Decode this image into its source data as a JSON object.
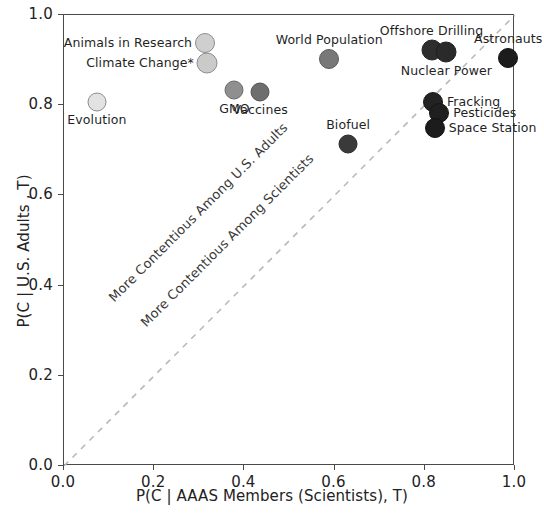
{
  "chart_data": {
    "type": "scatter",
    "title": "",
    "xlabel": "P(C | AAAS Members (Scientists), T)",
    "ylabel": "P(C | U.S. Adults , T)",
    "xlim": [
      0.0,
      1.0
    ],
    "ylim": [
      0.0,
      1.0
    ],
    "xticks": [
      "0.0",
      "0.2",
      "0.4",
      "0.6",
      "0.8",
      "1.0"
    ],
    "yticks": [
      "0.0",
      "0.2",
      "0.4",
      "0.6",
      "0.8",
      "1.0"
    ],
    "xtick_values": [
      0.0,
      0.2,
      0.4,
      0.6,
      0.8,
      1.0
    ],
    "ytick_values": [
      0.0,
      0.2,
      0.4,
      0.6,
      0.8,
      1.0
    ],
    "grid": false,
    "legend": "none",
    "reference_line": {
      "kind": "identity",
      "style": "dashed",
      "color": "#b9b9b9",
      "from": [
        0.0,
        0.0
      ],
      "to": [
        1.0,
        1.0
      ]
    },
    "annotations": [
      {
        "text": "More Contentious Among U.S. Adults",
        "rotation": -45,
        "color": "#3a3a3a"
      },
      {
        "text": "More Contentious Among Scientists",
        "rotation": -45,
        "color": "#3a3a3a"
      }
    ],
    "points": [
      {
        "label": "Evolution",
        "x": 0.073,
        "y": 0.808,
        "color": "#e2e2e2",
        "edge": "#8c8c8c",
        "r": 9.5,
        "label_pos": "below"
      },
      {
        "label": "Animals in Research",
        "x": 0.313,
        "y": 0.938,
        "color": "#cfcfcf",
        "edge": "#8c8c8c",
        "r": 10.0,
        "label_pos": "left"
      },
      {
        "label": "Climate Change*",
        "x": 0.318,
        "y": 0.893,
        "color": "#cacaca",
        "edge": "#8c8c8c",
        "r": 10.5,
        "label_pos": "left"
      },
      {
        "label": "GMO",
        "x": 0.378,
        "y": 0.833,
        "color": "#8f8f8f",
        "edge": "#6a6a6a",
        "r": 9.5,
        "label_pos": "below"
      },
      {
        "label": "Vaccines",
        "x": 0.435,
        "y": 0.83,
        "color": "#6e6e6e",
        "edge": "#565656",
        "r": 9.5,
        "label_pos": "below"
      },
      {
        "label": "World Population",
        "x": 0.588,
        "y": 0.902,
        "color": "#787878",
        "edge": "#5c5c5c",
        "r": 10.0,
        "label_pos": "above"
      },
      {
        "label": "Biofuel",
        "x": 0.63,
        "y": 0.715,
        "color": "#3a3a3a",
        "edge": "#2a2a2a",
        "r": 9.5,
        "label_pos": "above"
      },
      {
        "label": "Offshore Drilling",
        "x": 0.815,
        "y": 0.922,
        "color": "#2e2e2e",
        "edge": "#242424",
        "r": 10.5,
        "label_pos": "above"
      },
      {
        "label": "Nuclear Power",
        "x": 0.848,
        "y": 0.918,
        "color": "#2a2a2a",
        "edge": "#202020",
        "r": 10.5,
        "label_pos": "below"
      },
      {
        "label": "Fracking",
        "x": 0.818,
        "y": 0.808,
        "color": "#232323",
        "edge": "#1a1a1a",
        "r": 10.0,
        "label_pos": "right"
      },
      {
        "label": "Pesticides",
        "x": 0.832,
        "y": 0.782,
        "color": "#1f1f1f",
        "edge": "#161616",
        "r": 10.0,
        "label_pos": "right"
      },
      {
        "label": "Space Station",
        "x": 0.822,
        "y": 0.75,
        "color": "#1c1c1c",
        "edge": "#121212",
        "r": 10.0,
        "label_pos": "right"
      },
      {
        "label": "Astronauts",
        "x": 0.985,
        "y": 0.905,
        "color": "#1c1c1c",
        "edge": "#121212",
        "r": 10.0,
        "label_pos": "above"
      }
    ]
  }
}
